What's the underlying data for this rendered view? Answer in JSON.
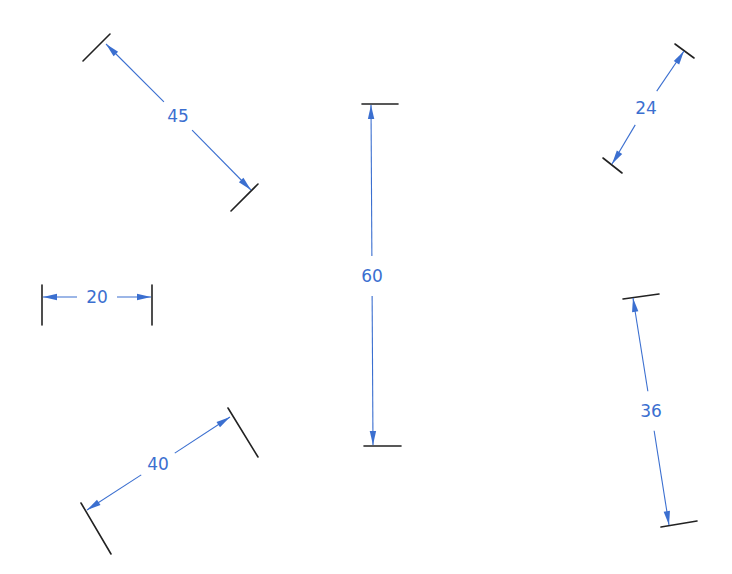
{
  "diagram": {
    "type": "dimension-annotations",
    "colors": {
      "dimension_line": "#3b6fd0",
      "extension_line": "#222222",
      "background": "#ffffff"
    },
    "dimensions": [
      {
        "id": "dim-45",
        "label": "45",
        "orientation": "diagonal"
      },
      {
        "id": "dim-60",
        "label": "60",
        "orientation": "vertical"
      },
      {
        "id": "dim-24",
        "label": "24",
        "orientation": "diagonal"
      },
      {
        "id": "dim-20",
        "label": "20",
        "orientation": "horizontal"
      },
      {
        "id": "dim-36",
        "label": "36",
        "orientation": "near-vertical"
      },
      {
        "id": "dim-40",
        "label": "40",
        "orientation": "diagonal"
      }
    ]
  }
}
